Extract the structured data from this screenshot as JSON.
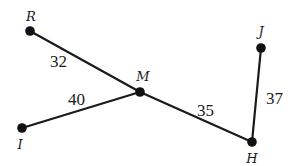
{
  "diagram": {
    "points": [
      {
        "id": "R",
        "label": "R",
        "x": 30,
        "y": 31,
        "lx": 31,
        "ly": 21
      },
      {
        "id": "M",
        "label": "M",
        "x": 140,
        "y": 92,
        "lx": 143,
        "ly": 81
      },
      {
        "id": "I",
        "label": "I",
        "x": 22,
        "y": 128,
        "lx": 20,
        "ly": 149
      },
      {
        "id": "H",
        "label": "H",
        "x": 252,
        "y": 142,
        "lx": 252,
        "ly": 163
      },
      {
        "id": "J",
        "label": "J",
        "x": 261,
        "y": 48,
        "lx": 261,
        "ly": 36
      }
    ],
    "segments": [
      {
        "from": "R",
        "to": "M",
        "length": "32",
        "lx": 50,
        "ly": 67
      },
      {
        "from": "I",
        "to": "M",
        "length": "40",
        "lx": 68,
        "ly": 105
      },
      {
        "from": "M",
        "to": "H",
        "length": "35",
        "lx": 197,
        "ly": 116
      },
      {
        "from": "H",
        "to": "J",
        "length": "37",
        "lx": 266,
        "ly": 104
      }
    ]
  }
}
